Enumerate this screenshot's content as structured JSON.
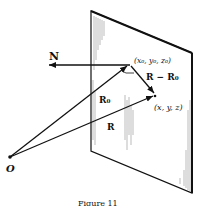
{
  "diagram": {
    "labels": {
      "normal": "N",
      "point0": "(x₀, y₀, z₀)",
      "diff": "R − R₀",
      "r0": "R₀",
      "point": "(x, y, z)",
      "r": "R",
      "origin": "O"
    },
    "caption": "Figure 11"
  }
}
